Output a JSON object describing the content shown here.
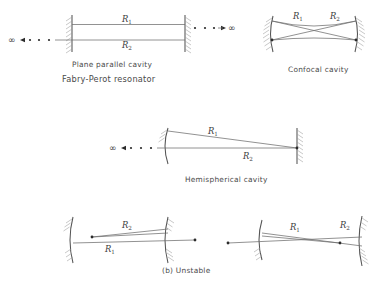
{
  "figure": {
    "caption_bottom": "(b) Unstable",
    "symbols": {
      "infinity": "∞"
    },
    "colors": {
      "ray": "#6e6e6e",
      "mirror": "#555555",
      "hatch": "#9a9a9a",
      "dot": "#2b2b2b",
      "text": "#4a4a4a",
      "background": "#ffffff"
    }
  },
  "diagrams": [
    {
      "id": "plane-parallel",
      "captions": [
        "Plane parallel cavity",
        "Fabry-Perot resonator"
      ],
      "labels": {
        "r1": "R",
        "r1_sub": "1",
        "r2": "R",
        "r2_sub": "2"
      },
      "left_infinity": "∞",
      "right_infinity": "∞",
      "mirror_left_type": "plane",
      "mirror_right_type": "plane",
      "dots_left": 3,
      "dots_right": 3
    },
    {
      "id": "confocal",
      "captions": [
        "Confocal cavity"
      ],
      "labels": {
        "r1": "R",
        "r1_sub": "1",
        "r2": "R",
        "r2_sub": "2"
      },
      "mirror_left_type": "concave",
      "mirror_right_type": "concave",
      "focus_dots": 2
    },
    {
      "id": "hemispherical",
      "captions": [
        "Hemispherical cavity"
      ],
      "labels": {
        "r1": "R",
        "r1_sub": "1",
        "r2": "R",
        "r2_sub": "2"
      },
      "left_infinity": "∞",
      "mirror_left_type": "concave",
      "mirror_right_type": "plane",
      "dots_left": 3,
      "focus_dots": 1
    },
    {
      "id": "unstable-left",
      "captions": [],
      "labels": {
        "r1": "R",
        "r1_sub": "1",
        "r2": "R",
        "r2_sub": "2"
      },
      "mirror_left_type": "concave",
      "mirror_right_type": "concave",
      "focus_dots": 2
    },
    {
      "id": "unstable-right",
      "captions": [],
      "labels": {
        "r1": "R",
        "r1_sub": "1",
        "r2": "R",
        "r2_sub": "2"
      },
      "mirror_left_type": "concave",
      "mirror_right_type": "concave",
      "focus_dots": 2
    }
  ]
}
